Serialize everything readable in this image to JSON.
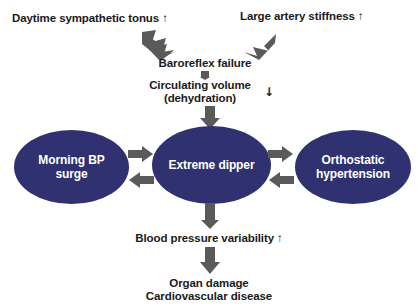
{
  "diagram": {
    "colors": {
      "ellipse_fill": "#2f3170",
      "ellipse_text": "#ffffff",
      "body_text": "#1a1a1a",
      "arrow_fill": "#5a5a5a",
      "background": "#ffffff"
    },
    "nodes": {
      "daytime_sympathetic_tonus": "Daytime sympathetic tonus ↑",
      "large_artery_stiffness": "Large artery stiffness ↑",
      "baroreflex_failure": "Baroreflex failure",
      "circulating_volume_line1": "Circulating volume",
      "circulating_volume_line2": "(dehydration)",
      "circulating_volume_marker": "↓",
      "morning_bp_surge": "Morning BP\nsurge",
      "extreme_dipper": "Extreme dipper",
      "orthostatic_hypertension": "Orthostatic\nhypertension",
      "blood_pressure_variability": "Blood pressure variability ↑",
      "outcome_line1": "Organ damage",
      "outcome_line2": "Cardiovascular disease"
    },
    "arrows": [
      {
        "name": "arrow-tonus-to-baroreflex",
        "direction": "down-right"
      },
      {
        "name": "arrow-stiffness-to-baroreflex",
        "direction": "down-left"
      },
      {
        "name": "arrow-baroreflex-to-volume",
        "direction": "down"
      },
      {
        "name": "arrow-volume-to-extreme-dipper",
        "direction": "down"
      },
      {
        "name": "arrow-extreme-dipper-to-morning-bp-surge",
        "direction": "left"
      },
      {
        "name": "arrow-morning-bp-surge-to-extreme-dipper",
        "direction": "right"
      },
      {
        "name": "arrow-extreme-dipper-to-orthostatic",
        "direction": "right"
      },
      {
        "name": "arrow-orthostatic-to-extreme-dipper",
        "direction": "left"
      },
      {
        "name": "arrow-extreme-dipper-to-bp-variability",
        "direction": "down"
      },
      {
        "name": "arrow-bp-variability-to-outcome",
        "direction": "down"
      }
    ]
  }
}
